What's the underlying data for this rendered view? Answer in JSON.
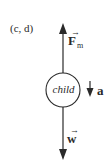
{
  "diagram": {
    "type": "free-body diagram",
    "part_label": "(c, d)",
    "object": {
      "label": "child",
      "shape": "circle"
    },
    "forces": [
      {
        "name": "F",
        "subscript": "m",
        "vector": true,
        "direction": "up"
      },
      {
        "name": "w",
        "subscript": "",
        "vector": true,
        "direction": "down"
      }
    ],
    "acceleration": {
      "name": "a",
      "direction": "down"
    },
    "colors": {
      "stroke": "#2a2a2a",
      "background": "#ffffff"
    }
  }
}
